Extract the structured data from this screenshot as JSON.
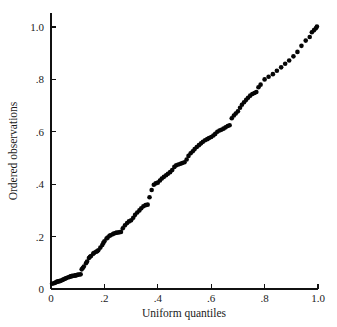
{
  "chart_data": {
    "type": "scatter",
    "title": "",
    "xlabel": "Uniform quantiles",
    "ylabel": "Ordered observations",
    "xlim": [
      0,
      1.0
    ],
    "ylim": [
      0,
      1.0
    ],
    "grid": false,
    "legend": null,
    "xticks": [
      0,
      0.2,
      0.4,
      0.6,
      0.8,
      1.0
    ],
    "xtick_labels": [
      "0",
      ".2",
      ".4",
      ".6",
      ".8",
      "1.0"
    ],
    "yticks": [
      0,
      0.2,
      0.4,
      0.6,
      0.8,
      1.0
    ],
    "ytick_labels": [
      "0",
      ".2",
      ".4",
      ".6",
      ".8",
      "1.0"
    ],
    "marker": "filled-circle",
    "marker_color": "#050505",
    "marker_size_px": 2.3,
    "n_points": 131,
    "x": [
      0.004,
      0.011,
      0.015,
      0.019,
      0.023,
      0.027,
      0.031,
      0.035,
      0.042,
      0.046,
      0.05,
      0.054,
      0.058,
      0.065,
      0.069,
      0.073,
      0.077,
      0.081,
      0.088,
      0.092,
      0.096,
      0.1,
      0.104,
      0.111,
      0.115,
      0.119,
      0.123,
      0.131,
      0.135,
      0.142,
      0.146,
      0.15,
      0.158,
      0.162,
      0.169,
      0.173,
      0.177,
      0.185,
      0.192,
      0.196,
      0.2,
      0.208,
      0.212,
      0.219,
      0.223,
      0.231,
      0.235,
      0.242,
      0.246,
      0.254,
      0.262,
      0.269,
      0.277,
      0.285,
      0.292,
      0.3,
      0.308,
      0.315,
      0.323,
      0.331,
      0.338,
      0.346,
      0.354,
      0.362,
      0.369,
      0.377,
      0.385,
      0.392,
      0.4,
      0.408,
      0.415,
      0.423,
      0.431,
      0.438,
      0.446,
      0.454,
      0.462,
      0.469,
      0.477,
      0.485,
      0.492,
      0.5,
      0.508,
      0.515,
      0.523,
      0.531,
      0.538,
      0.546,
      0.554,
      0.562,
      0.569,
      0.577,
      0.585,
      0.592,
      0.6,
      0.608,
      0.615,
      0.623,
      0.631,
      0.638,
      0.646,
      0.654,
      0.662,
      0.669,
      0.677,
      0.685,
      0.692,
      0.7,
      0.708,
      0.715,
      0.723,
      0.731,
      0.738,
      0.746,
      0.754,
      0.762,
      0.769,
      0.777,
      0.785,
      0.8,
      0.815,
      0.831,
      0.846,
      0.862,
      0.877,
      0.892,
      0.908,
      0.923,
      0.938,
      0.954,
      0.969,
      0.977,
      0.985,
      0.992,
      0.996
    ],
    "y": [
      0.02,
      0.022,
      0.024,
      0.026,
      0.028,
      0.029,
      0.03,
      0.031,
      0.034,
      0.036,
      0.038,
      0.04,
      0.042,
      0.045,
      0.046,
      0.048,
      0.049,
      0.05,
      0.051,
      0.052,
      0.053,
      0.054,
      0.055,
      0.056,
      0.075,
      0.08,
      0.086,
      0.098,
      0.105,
      0.118,
      0.123,
      0.126,
      0.135,
      0.138,
      0.142,
      0.144,
      0.148,
      0.158,
      0.168,
      0.176,
      0.182,
      0.193,
      0.196,
      0.203,
      0.205,
      0.209,
      0.212,
      0.214,
      0.215,
      0.216,
      0.218,
      0.232,
      0.243,
      0.252,
      0.258,
      0.262,
      0.272,
      0.283,
      0.292,
      0.3,
      0.308,
      0.316,
      0.32,
      0.322,
      0.35,
      0.378,
      0.398,
      0.403,
      0.406,
      0.414,
      0.422,
      0.428,
      0.434,
      0.44,
      0.446,
      0.454,
      0.466,
      0.472,
      0.475,
      0.478,
      0.481,
      0.484,
      0.494,
      0.508,
      0.518,
      0.526,
      0.534,
      0.542,
      0.549,
      0.556,
      0.562,
      0.568,
      0.572,
      0.576,
      0.58,
      0.586,
      0.592,
      0.6,
      0.605,
      0.608,
      0.612,
      0.617,
      0.622,
      0.625,
      0.652,
      0.662,
      0.67,
      0.678,
      0.692,
      0.703,
      0.713,
      0.722,
      0.73,
      0.738,
      0.744,
      0.748,
      0.752,
      0.77,
      0.78,
      0.8,
      0.81,
      0.82,
      0.833,
      0.846,
      0.86,
      0.872,
      0.888,
      0.905,
      0.928,
      0.948,
      0.962,
      0.98,
      0.988,
      0.995,
      1.002
    ]
  }
}
